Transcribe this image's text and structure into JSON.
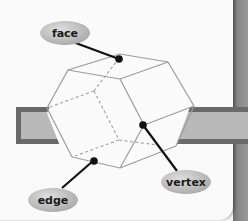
{
  "diagram": {
    "labels": {
      "face": "face",
      "edge": "edge",
      "vertex": "vertex"
    },
    "colors": {
      "bubble_fill": "#bdbdbd",
      "bubble_highlight": "#d9d9d9",
      "leader_line": "#111111",
      "solid_edge": "#9c9c9c",
      "hidden_edge": "#b0b0b0",
      "band_outer": "#6a6a6a",
      "band_inner": "#b8b8b8",
      "panel_bg": "#fafafa",
      "side_strip": "#7d7d7d"
    }
  }
}
